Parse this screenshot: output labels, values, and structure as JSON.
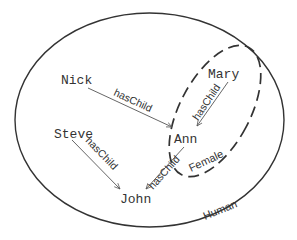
{
  "diagram": {
    "type": "venn-ontology",
    "sets": [
      {
        "id": "human",
        "label": "Human",
        "style": "solid"
      },
      {
        "id": "female",
        "label": "Female",
        "style": "dashed"
      }
    ],
    "nodes": [
      {
        "id": "nick",
        "label": "Nick"
      },
      {
        "id": "mary",
        "label": "Mary"
      },
      {
        "id": "steve",
        "label": "Steve"
      },
      {
        "id": "ann",
        "label": "Ann"
      },
      {
        "id": "john",
        "label": "John"
      }
    ],
    "edges": [
      {
        "from": "Nick",
        "to": "Ann",
        "label": "hasChild"
      },
      {
        "from": "Mary",
        "to": "Ann",
        "label": "hasChild"
      },
      {
        "from": "Steve",
        "to": "John",
        "label": "hasChild"
      },
      {
        "from": "Ann",
        "to": "John",
        "label": "hasChild"
      }
    ],
    "colors": {
      "stroke": "#333333",
      "edge": "#555555",
      "background": "#ffffff"
    }
  }
}
